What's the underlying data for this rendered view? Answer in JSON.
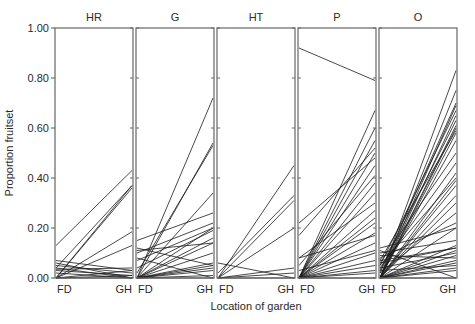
{
  "chart_data": {
    "type": "line",
    "title": "",
    "xlabel": "Location of garden",
    "ylabel": "Proportion fruitset",
    "ylim": [
      0,
      1
    ],
    "yticks": [
      "0.00",
      "0.20",
      "0.40",
      "0.60",
      "0.80",
      "1.00"
    ],
    "ytick_values": [
      0,
      0.2,
      0.4,
      0.6,
      0.8,
      1.0
    ],
    "x_categories": [
      "FD",
      "GH"
    ],
    "grid": false,
    "legend": null,
    "panels": [
      {
        "name": "HR",
        "segments": [
          [
            0.13,
            0.43
          ],
          [
            0.04,
            0.37
          ],
          [
            0.0,
            0.37
          ],
          [
            0.0,
            0.36
          ],
          [
            0.0,
            0.185
          ],
          [
            0.0,
            0.13
          ],
          [
            0.07,
            0.03
          ],
          [
            0.06,
            0.0
          ],
          [
            0.05,
            0.02
          ],
          [
            0.04,
            0.0
          ],
          [
            0.035,
            0.04
          ],
          [
            0.03,
            0.01
          ],
          [
            0.0,
            0.03
          ],
          [
            0.0,
            0.01
          ],
          [
            0.02,
            0.0
          ],
          [
            0.0,
            0.0
          ]
        ]
      },
      {
        "name": "G",
        "segments": [
          [
            0.0,
            0.72
          ],
          [
            0.0,
            0.54
          ],
          [
            0.02,
            0.53
          ],
          [
            0.0,
            0.34
          ],
          [
            0.15,
            0.26
          ],
          [
            0.1,
            0.22
          ],
          [
            0.0,
            0.2
          ],
          [
            0.07,
            0.2
          ],
          [
            0.04,
            0.19
          ],
          [
            0.0,
            0.16
          ],
          [
            0.0,
            0.14
          ],
          [
            0.08,
            0.0
          ],
          [
            0.11,
            0.14
          ],
          [
            0.0,
            0.1
          ],
          [
            0.0,
            0.06
          ],
          [
            0.0,
            0.05
          ],
          [
            0.0,
            0.04
          ],
          [
            0.0,
            0.03
          ],
          [
            0.0,
            0.01
          ],
          [
            0.0,
            0.0
          ],
          [
            0.12,
            0.05
          ]
        ]
      },
      {
        "name": "HT",
        "segments": [
          [
            0.0,
            0.45
          ],
          [
            0.02,
            0.33
          ],
          [
            0.0,
            0.31
          ],
          [
            0.0,
            0.2
          ],
          [
            0.06,
            0.0
          ],
          [
            0.0,
            0.04
          ],
          [
            0.0,
            0.02
          ],
          [
            0.0,
            0.0
          ]
        ]
      },
      {
        "name": "P",
        "segments": [
          [
            0.92,
            0.79
          ],
          [
            0.0,
            0.67
          ],
          [
            0.0,
            0.6
          ],
          [
            0.0,
            0.55
          ],
          [
            0.22,
            0.48
          ],
          [
            0.17,
            0.52
          ],
          [
            0.0,
            0.5
          ],
          [
            0.0,
            0.45
          ],
          [
            0.05,
            0.41
          ],
          [
            0.0,
            0.38
          ],
          [
            0.0,
            0.34
          ],
          [
            0.08,
            0.3
          ],
          [
            0.0,
            0.27
          ],
          [
            0.0,
            0.24
          ],
          [
            0.0,
            0.22
          ],
          [
            0.0,
            0.18
          ],
          [
            0.0,
            0.14
          ],
          [
            0.0,
            0.1
          ],
          [
            0.0,
            0.07
          ],
          [
            0.0,
            0.05
          ],
          [
            0.0,
            0.03
          ],
          [
            0.0,
            0.02
          ],
          [
            0.0,
            0.0
          ],
          [
            0.03,
            0.11
          ],
          [
            0.08,
            0.17
          ]
        ]
      },
      {
        "name": "O",
        "segments": [
          [
            0.0,
            0.83
          ],
          [
            0.0,
            0.75
          ],
          [
            0.02,
            0.7
          ],
          [
            0.0,
            0.69
          ],
          [
            0.05,
            0.67
          ],
          [
            0.0,
            0.65
          ],
          [
            0.03,
            0.63
          ],
          [
            0.0,
            0.61
          ],
          [
            0.0,
            0.6
          ],
          [
            0.07,
            0.59
          ],
          [
            0.0,
            0.58
          ],
          [
            0.0,
            0.55
          ],
          [
            0.0,
            0.42
          ],
          [
            0.05,
            0.4
          ],
          [
            0.0,
            0.39
          ],
          [
            0.0,
            0.37
          ],
          [
            0.0,
            0.33
          ],
          [
            0.0,
            0.3
          ],
          [
            0.08,
            0.22
          ],
          [
            0.0,
            0.2
          ],
          [
            0.1,
            0.15
          ],
          [
            0.0,
            0.13
          ],
          [
            0.06,
            0.12
          ],
          [
            0.0,
            0.11
          ],
          [
            0.04,
            0.1
          ],
          [
            0.0,
            0.09
          ],
          [
            0.09,
            0.08
          ],
          [
            0.0,
            0.07
          ],
          [
            0.0,
            0.06
          ],
          [
            0.03,
            0.05
          ],
          [
            0.0,
            0.04
          ],
          [
            0.0,
            0.03
          ],
          [
            0.11,
            0.0
          ],
          [
            0.0,
            0.0
          ],
          [
            0.07,
            0.12
          ],
          [
            0.12,
            0.2
          ],
          [
            0.02,
            0.26
          ],
          [
            0.06,
            0.5
          ],
          [
            0.04,
            0.46
          ]
        ]
      }
    ]
  },
  "axis": {
    "ylabel": "Proportion fruitset",
    "xlabel": "Location of garden",
    "fd_label": "FD",
    "gh_label": "GH"
  }
}
